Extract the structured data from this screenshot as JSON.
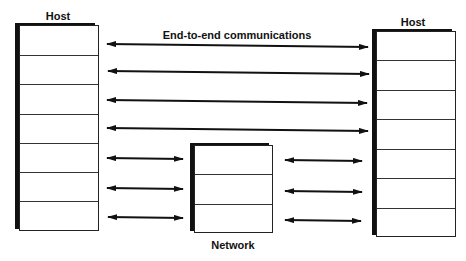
{
  "diagram": {
    "left_host": {
      "label": "Host",
      "layers": 7
    },
    "right_host": {
      "label": "Host",
      "layers": 7
    },
    "network": {
      "label": "Network",
      "layers": 3
    },
    "end_to_end_label": "End-to-end communications",
    "colors": {
      "line": "#111111",
      "background": "#ffffff"
    }
  }
}
